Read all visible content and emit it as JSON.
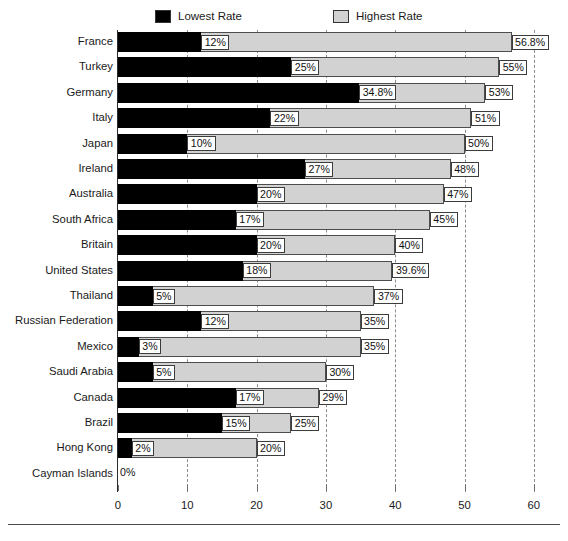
{
  "legend": {
    "items": [
      {
        "label": "Lowest Rate",
        "color": "#000000",
        "name": "legend-lowest"
      },
      {
        "label": "Highest Rate",
        "color": "#d2d2d2",
        "name": "legend-highest"
      }
    ]
  },
  "axis": {
    "ticks": [
      "0",
      "10",
      "20",
      "30",
      "40",
      "50",
      "60"
    ],
    "min": 0,
    "max": 60
  },
  "chart_data": {
    "type": "bar",
    "title": "",
    "subtitle": "",
    "xlabel": "",
    "ylabel": "",
    "orientation": "horizontal",
    "grid": true,
    "legend_position": "top",
    "xlim": [
      0,
      60
    ],
    "xticks": [
      0,
      10,
      20,
      30,
      40,
      50,
      60
    ],
    "categories": [
      "France",
      "Turkey",
      "Germany",
      "Italy",
      "Japan",
      "Ireland",
      "Australia",
      "South Africa",
      "Britain",
      "United States",
      "Thailand",
      "Russian Federation",
      "Mexico",
      "Saudi Arabia",
      "Canada",
      "Brazil",
      "Hong Kong",
      "Cayman Islands"
    ],
    "series": [
      {
        "name": "Lowest Rate",
        "color": "#000000",
        "values": [
          12,
          25,
          34.8,
          22,
          10,
          27,
          20,
          17,
          20,
          18,
          5,
          12,
          3,
          5,
          17,
          15,
          2,
          0
        ],
        "labels": [
          "12%",
          "25%",
          "34.8%",
          "22%",
          "10%",
          "27%",
          "20%",
          "17%",
          "20%",
          "18%",
          "5%",
          "12%",
          "3%",
          "5%",
          "17%",
          "15%",
          "2%",
          "0%"
        ]
      },
      {
        "name": "Highest Rate",
        "color": "#d2d2d2",
        "values": [
          56.8,
          55,
          53,
          51,
          50,
          48,
          47,
          45,
          40,
          39.6,
          37,
          35,
          35,
          30,
          29,
          25,
          20,
          0
        ],
        "labels": [
          "56.8%",
          "55%",
          "53%",
          "51%",
          "50%",
          "48%",
          "47%",
          "45%",
          "40%",
          "39.6%",
          "37%",
          "35%",
          "35%",
          "30%",
          "29%",
          "25%",
          "20%",
          ""
        ]
      }
    ]
  }
}
